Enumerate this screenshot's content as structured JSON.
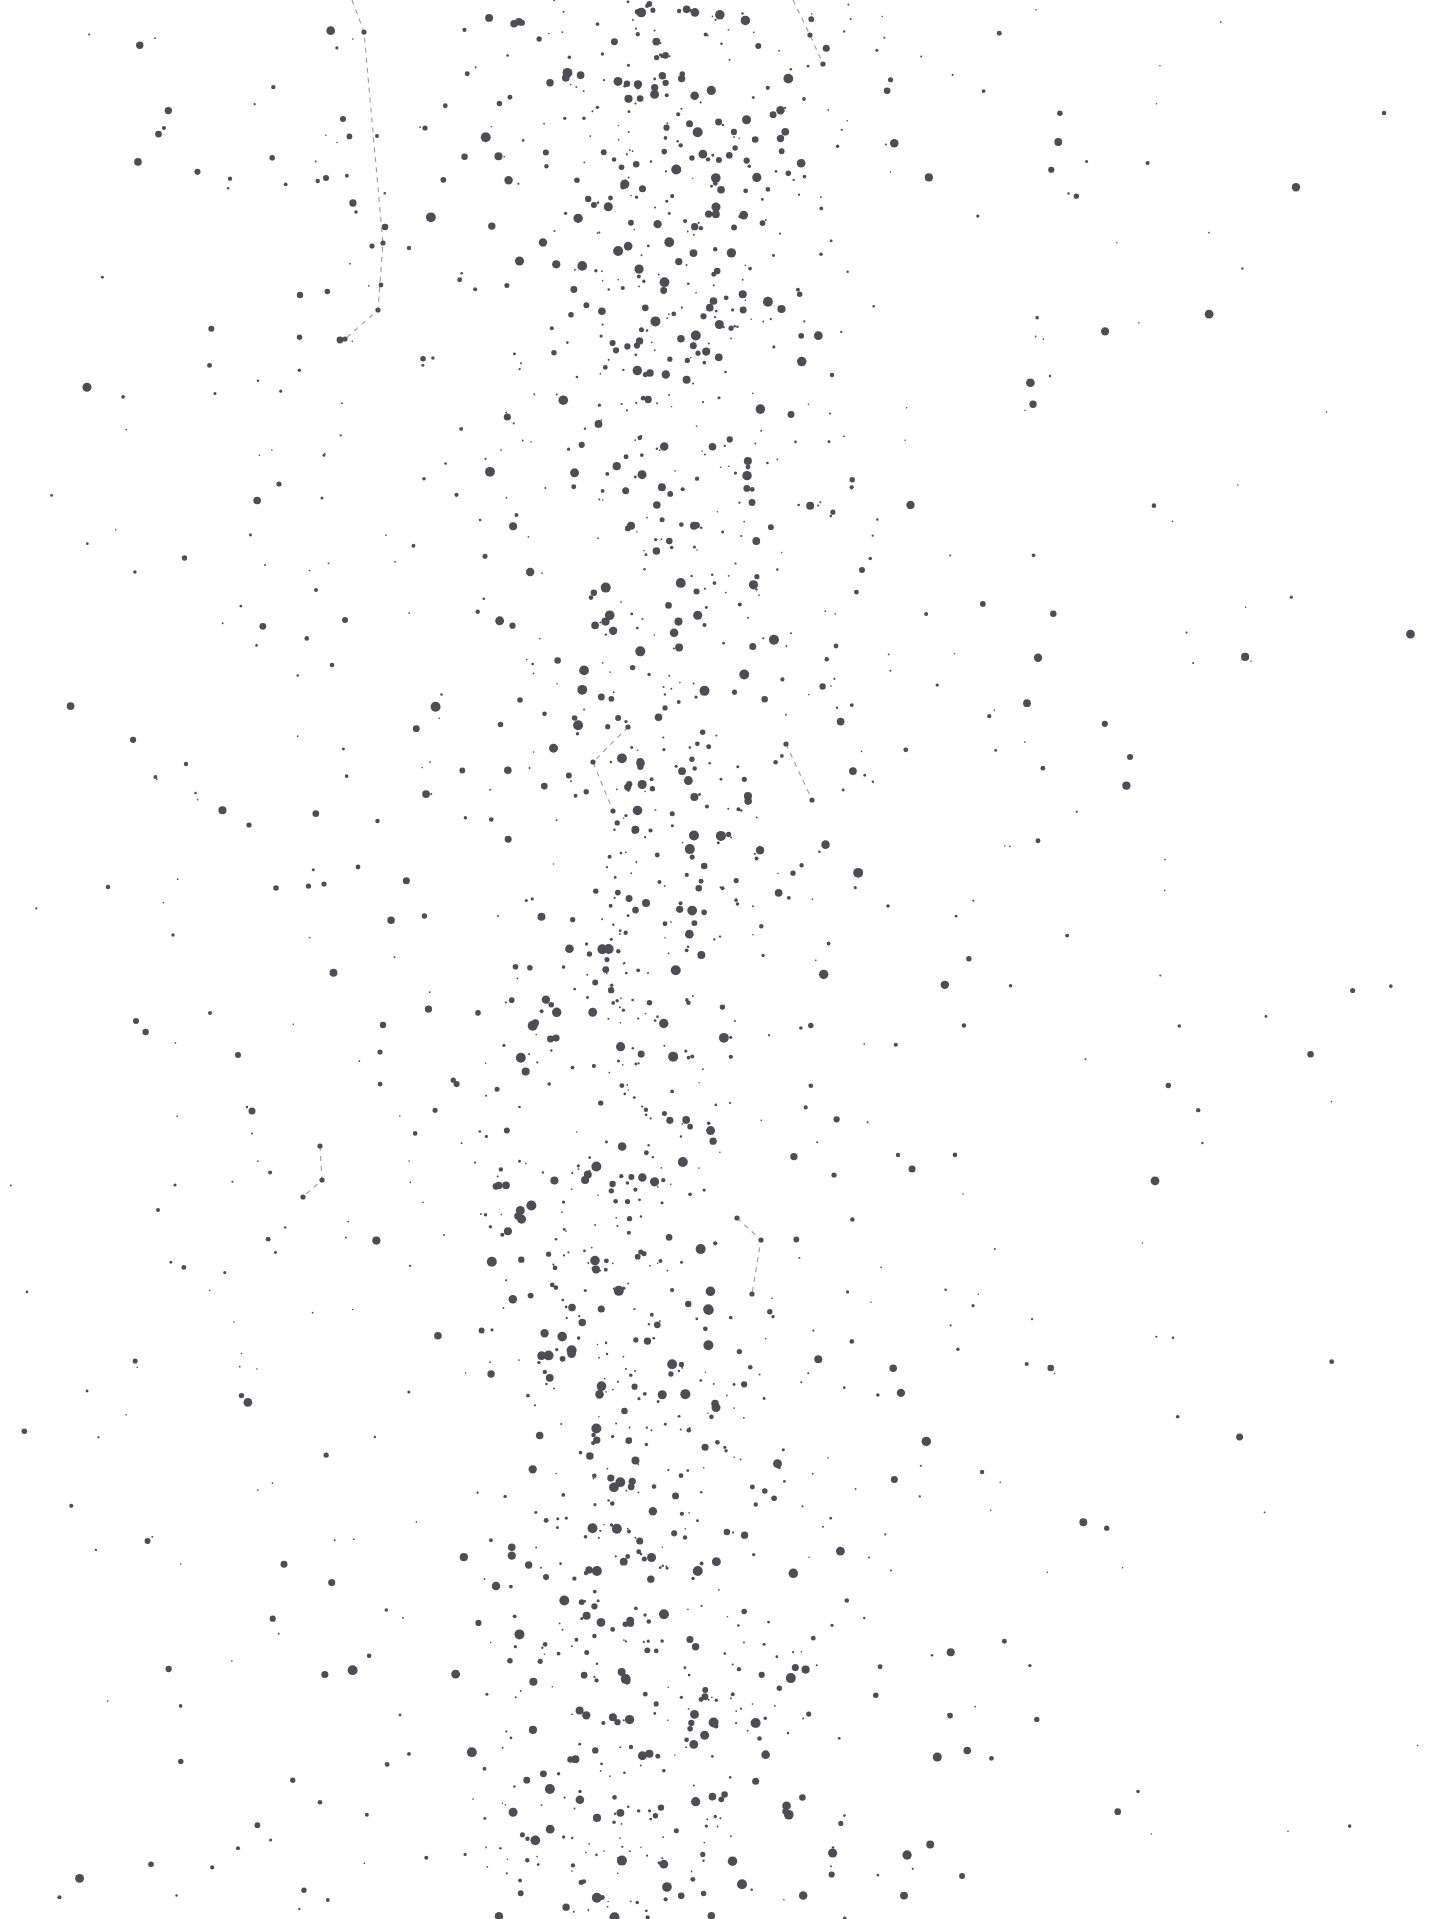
{
  "chart_data": {
    "type": "scatter",
    "title": "",
    "subtitle": "",
    "xlabel": "",
    "ylabel": "",
    "xlim": [
      0,
      1440
    ],
    "ylim": [
      0,
      1919
    ],
    "grid": false,
    "legend": null,
    "background_color": "#ffffff",
    "star_color": "#4d4d55",
    "line_color": "#9a9aa2",
    "magnitude_scale": {
      "encoding": "dot radius in px maps to star brightness",
      "min_radius": 0.8,
      "max_radius": 5.0
    },
    "band": {
      "name": "galactic-plane-band",
      "center_x_top": 655,
      "center_x_bottom": 640,
      "half_width_core": 130,
      "half_width_falloff": 330,
      "top_density": 1.0,
      "mid_density": 0.72,
      "bottom_density": 0.92
    },
    "field_density": {
      "left_sparse_density": 0.055,
      "right_sparse_density": 0.045,
      "total_star_estimate": 2600
    },
    "named_stars": [
      {
        "x": 343,
        "y": 119,
        "r": 3.0
      },
      {
        "x": 377,
        "y": 136,
        "r": 2.0
      },
      {
        "x": 425,
        "y": 128,
        "r": 2.6
      },
      {
        "x": 385,
        "y": 227,
        "r": 3.3
      },
      {
        "x": 326,
        "y": 178,
        "r": 3.0
      },
      {
        "x": 356,
        "y": 212,
        "r": 1.8
      },
      {
        "x": 409,
        "y": 248,
        "r": 2.2
      },
      {
        "x": 372,
        "y": 246,
        "r": 2.6
      },
      {
        "x": 300,
        "y": 295,
        "r": 3.2
      },
      {
        "x": 381,
        "y": 285,
        "r": 2.4
      },
      {
        "x": 340,
        "y": 340,
        "r": 3.4
      },
      {
        "x": 279,
        "y": 484,
        "r": 2.6
      },
      {
        "x": 322,
        "y": 498,
        "r": 1.6
      },
      {
        "x": 316,
        "y": 590,
        "r": 2.0
      },
      {
        "x": 345,
        "y": 620,
        "r": 3.0
      },
      {
        "x": 332,
        "y": 665,
        "r": 2.3
      },
      {
        "x": 520,
        "y": 700,
        "r": 2.8
      },
      {
        "x": 186,
        "y": 764,
        "r": 2.2
      },
      {
        "x": 249,
        "y": 825,
        "r": 2.6
      },
      {
        "x": 136,
        "y": 1021,
        "r": 3.0
      },
      {
        "x": 210,
        "y": 1013,
        "r": 2.0
      },
      {
        "x": 238,
        "y": 1055,
        "r": 3.0
      },
      {
        "x": 173,
        "y": 935,
        "r": 1.7
      },
      {
        "x": 383,
        "y": 1025,
        "r": 3.2
      },
      {
        "x": 380,
        "y": 1052,
        "r": 2.6
      },
      {
        "x": 158,
        "y": 1210,
        "r": 2.0
      },
      {
        "x": 175,
        "y": 1185,
        "r": 1.6
      },
      {
        "x": 276,
        "y": 888,
        "r": 2.8
      },
      {
        "x": 324,
        "y": 884,
        "r": 2.6
      },
      {
        "x": 358,
        "y": 867,
        "r": 2.4
      },
      {
        "x": 888,
        "y": 906,
        "r": 1.8
      },
      {
        "x": 862,
        "y": 570,
        "r": 3.0
      },
      {
        "x": 836,
        "y": 646,
        "r": 2.4
      },
      {
        "x": 898,
        "y": 1155,
        "r": 2.2
      },
      {
        "x": 834,
        "y": 1175,
        "r": 2.6
      }
    ],
    "constellation_lines": [
      {
        "name": "constellation-line-top-left",
        "points": [
          [
            352,
            0
          ],
          [
            364,
            32
          ],
          [
            383,
            243
          ],
          [
            378,
            310
          ],
          [
            345,
            339
          ]
        ],
        "style": "dashed"
      },
      {
        "name": "constellation-line-top-right",
        "points": [
          [
            793,
            0
          ],
          [
            810,
            35
          ],
          [
            823,
            64
          ]
        ],
        "style": "dashed"
      },
      {
        "name": "constellation-line-mid-v",
        "points": [
          [
            628,
            727
          ],
          [
            593,
            762
          ],
          [
            613,
            811
          ]
        ],
        "style": "dashed"
      },
      {
        "name": "constellation-line-right-diagonal",
        "points": [
          [
            786,
            744
          ],
          [
            812,
            800
          ]
        ],
        "style": "dashed"
      },
      {
        "name": "constellation-line-lower-left-hook",
        "points": [
          [
            320,
            1146
          ],
          [
            322,
            1180
          ],
          [
            303,
            1197
          ]
        ],
        "style": "dashed"
      },
      {
        "name": "constellation-line-lower-right-box",
        "points": [
          [
            737,
            1218
          ],
          [
            761,
            1240
          ],
          [
            752,
            1294
          ]
        ],
        "style": "dashed"
      }
    ]
  },
  "chart": {
    "name": "star-chart",
    "alt": "Astronomical star chart showing a dense band of stars with dashed constellation lines"
  }
}
